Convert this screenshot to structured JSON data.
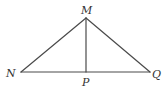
{
  "diagram": {
    "type": "geometry-triangle",
    "stroke_color": "#4a4a4a",
    "label_color": "#333333",
    "points": {
      "M": {
        "label": "M",
        "x": 86,
        "y": 18
      },
      "N": {
        "label": "N",
        "x": 21,
        "y": 72
      },
      "P": {
        "label": "P",
        "x": 86,
        "y": 72
      },
      "Q": {
        "label": "Q",
        "x": 150,
        "y": 72
      }
    },
    "segments": [
      {
        "from": "M",
        "to": "N"
      },
      {
        "from": "M",
        "to": "Q"
      },
      {
        "from": "N",
        "to": "Q"
      },
      {
        "from": "M",
        "to": "P"
      }
    ]
  }
}
